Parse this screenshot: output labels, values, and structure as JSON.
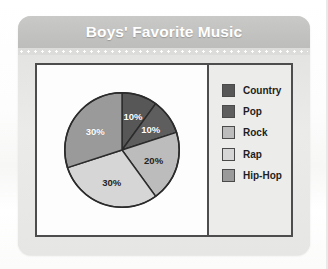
{
  "header": {
    "title": "Boys' Favorite Music"
  },
  "chart_data": {
    "type": "pie",
    "title": "Boys' Favorite Music",
    "xlabel": "",
    "ylabel": "",
    "legend_position": "right",
    "grid": false,
    "unit": "%",
    "start_angle_deg": 0,
    "direction": "clockwise",
    "categories": [
      "Country",
      "Pop",
      "Rock",
      "Rap",
      "Hip-Hop"
    ],
    "values": [
      10,
      10,
      20,
      30,
      30
    ],
    "labels": [
      "10%",
      "10%",
      "20%",
      "30%",
      "30%"
    ],
    "colors": [
      "#575757",
      "#5e5e5e",
      "#bcbcbc",
      "#d6d6d6",
      "#9a9a9a"
    ],
    "label_colors": [
      "#ffffff",
      "#ffffff",
      "#232323",
      "#232323",
      "#ffffff"
    ],
    "slices": [
      {
        "name": "Country",
        "value": 10,
        "label": "10%",
        "color": "#575757",
        "label_color": "#ffffff"
      },
      {
        "name": "Pop",
        "value": 10,
        "label": "10%",
        "color": "#5e5e5e",
        "label_color": "#ffffff"
      },
      {
        "name": "Rock",
        "value": 20,
        "label": "20%",
        "color": "#bcbcbc",
        "label_color": "#232323"
      },
      {
        "name": "Rap",
        "value": 30,
        "label": "30%",
        "color": "#d6d6d6",
        "label_color": "#232323"
      },
      {
        "name": "Hip-Hop",
        "value": 30,
        "label": "30%",
        "color": "#9a9a9a",
        "label_color": "#ffffff"
      }
    ]
  },
  "legend": {
    "items": [
      {
        "label": "Country",
        "color": "#575757"
      },
      {
        "label": "Pop",
        "color": "#5e5e5e"
      },
      {
        "label": "Rock",
        "color": "#bcbcbc"
      },
      {
        "label": "Rap",
        "color": "#d6d6d6"
      },
      {
        "label": "Hip-Hop",
        "color": "#9a9a9a"
      }
    ]
  },
  "theme": {
    "card_background": "#e4e4e3",
    "header_background": "#c2c2c1",
    "header_text": "#ffffff",
    "panel_border": "#4d4d4d",
    "pie_background": "#fdfdfd",
    "legend_background": "#ececeb",
    "slice_outline": "#2b2b2b"
  }
}
